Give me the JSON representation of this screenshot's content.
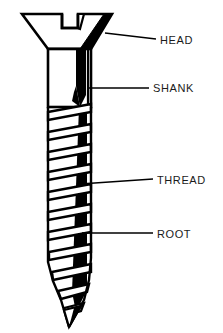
{
  "diagram": {
    "title": "",
    "background_color": "#ffffff",
    "line_color": "#000000",
    "fill_color": "#ffffff",
    "shade_color": "#000000",
    "label_color": "#1a1a1a",
    "width": 223,
    "height": 333
  },
  "labels": [
    {
      "id": "head",
      "text": "HEAD",
      "text_x": 160,
      "text_y": 35,
      "leader": {
        "x1": 105,
        "y1": 33,
        "x2": 156,
        "y2": 39
      }
    },
    {
      "id": "shank",
      "text": "SHANK",
      "text_x": 153,
      "text_y": 83,
      "leader": {
        "x1": 89,
        "y1": 88,
        "x2": 149,
        "y2": 88
      }
    },
    {
      "id": "thread",
      "text": "THREAD",
      "text_x": 157,
      "text_y": 175,
      "leader": {
        "x1": 80,
        "y1": 184,
        "x2": 153,
        "y2": 179
      }
    },
    {
      "id": "root",
      "text": "ROOT",
      "text_x": 157,
      "text_y": 229,
      "leader": {
        "x1": 82,
        "y1": 233,
        "x2": 153,
        "y2": 233
      }
    }
  ],
  "geometry": {
    "head": {
      "top_y": 14,
      "bottom_y": 49,
      "top_left_x": 22,
      "top_right_x": 112,
      "bottom_left_x": 48,
      "bottom_right_x": 91,
      "slot_left_x": 62,
      "slot_right_x": 78,
      "slot_depth_y": 28
    },
    "shank": {
      "top_y": 49,
      "bottom_y": 106,
      "left_x": 48,
      "right_x": 91
    },
    "thread": {
      "top_y": 106,
      "tip_y": 327,
      "left_x": 44,
      "right_x": 95,
      "turns": 11,
      "pitch": 20
    },
    "tip": {
      "point_x": 69,
      "point_y": 327
    }
  }
}
